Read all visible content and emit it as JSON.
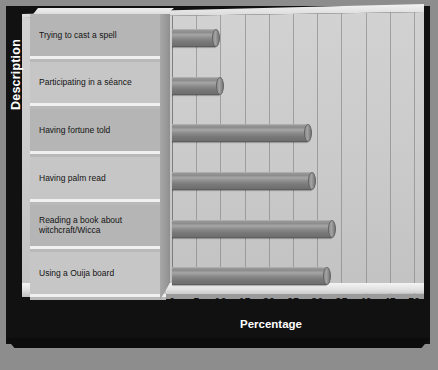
{
  "chart_data": {
    "type": "bar",
    "orientation": "horizontal",
    "title": "",
    "xlabel": "Percentage",
    "ylabel": "Description",
    "categories": [
      "Trying to cast a spell",
      "Participating in a séance",
      "Having fortune told",
      "Having palm read",
      "Reading a book about witchcraft/Wicca",
      "Using a Ouija board"
    ],
    "values": [
      9,
      10,
      28,
      29,
      33,
      32
    ],
    "xlim": [
      0,
      50
    ],
    "xticks": [
      0,
      5,
      10,
      15,
      20,
      25,
      30,
      35,
      40,
      45,
      50
    ],
    "xtick_labels": [
      "0",
      "5",
      "10",
      "15",
      "20",
      "25",
      "30",
      "35",
      "40",
      "45",
      "50"
    ],
    "grid": "vertical",
    "legend": "none",
    "style": "3d-cylinder-bars"
  },
  "colors": {
    "frame": "#111111",
    "page_background": "#8d8d8d",
    "plot_wall": "#cacaca",
    "bar_fill": "#8b8b8b",
    "label_panel": "#b5b5b5",
    "axis_title_text": "#ffffff",
    "tick_text": "#111111"
  },
  "caption": {
    "text": ""
  }
}
